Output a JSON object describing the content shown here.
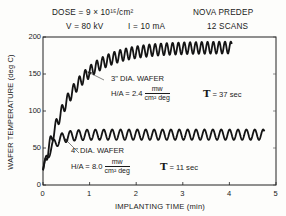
{
  "header": {
    "dose": "DOSE = 9 × 10¹⁵/cm²",
    "voltage": "V = 80 kV",
    "current": "I = 10 mA",
    "machine": "NOVA PREDEP",
    "scans": "12 SCANS"
  },
  "annotations": {
    "wafer3": {
      "label": "3\" DIA. WAFER",
      "ha_prefix": "H/A = 2.4",
      "ha_num": "mw",
      "ha_den": "cm² deg",
      "tau": "= 37 sec"
    },
    "wafer4": {
      "label": "4\" DIA. WAFER",
      "ha_prefix": "H/A = 8.0",
      "ha_num": "mw",
      "ha_den": "cm² deg",
      "tau": "= 11 sec"
    },
    "tau_symbol": "T"
  },
  "chart_data": {
    "type": "line",
    "xlabel": "IMPLANTING TIME (min)",
    "ylabel": "WAFER TEMPERATURE (deg C)",
    "xlim": [
      0,
      5
    ],
    "ylim": [
      0,
      200
    ],
    "xticks": [
      "0",
      "1",
      "2",
      "3",
      "4",
      "5"
    ],
    "yticks": [
      "0",
      "50",
      "100",
      "150",
      "200"
    ],
    "grid": false,
    "series": [
      {
        "name": "3\" DIA. WAFER (H/A = 2.4 mw/cm² deg, τ = 37 sec)",
        "envelope": {
          "start_temp": 20,
          "plateau": 186,
          "tau_min": 0.62,
          "end_time": 4.05
        },
        "oscillation": {
          "period_min": 0.125,
          "amplitude_deg": 8
        },
        "approx_points": [
          [
            0,
            20
          ],
          [
            0.2,
            62
          ],
          [
            0.5,
            110
          ],
          [
            1.0,
            150
          ],
          [
            1.5,
            172
          ],
          [
            2.0,
            181
          ],
          [
            2.5,
            185
          ],
          [
            3.0,
            186
          ],
          [
            3.5,
            186
          ],
          [
            4.05,
            186
          ]
        ]
      },
      {
        "name": "4\" DIA. WAFER (H/A = 8.0 mw/cm² deg, τ = 11 sec)",
        "envelope": {
          "start_temp": 20,
          "plateau": 68,
          "tau_min": 0.18,
          "end_time": 4.75
        },
        "oscillation": {
          "period_min": 0.18,
          "amplitude_deg": 7
        },
        "approx_points": [
          [
            0,
            20
          ],
          [
            0.1,
            45
          ],
          [
            0.2,
            58
          ],
          [
            0.4,
            65
          ],
          [
            1.0,
            68
          ],
          [
            2.0,
            68
          ],
          [
            3.0,
            68
          ],
          [
            4.0,
            68
          ],
          [
            4.75,
            68
          ]
        ]
      }
    ]
  },
  "plot": {
    "x0": 43,
    "x1": 276,
    "y0": 185,
    "y1": 37,
    "line_color": "#141414"
  }
}
